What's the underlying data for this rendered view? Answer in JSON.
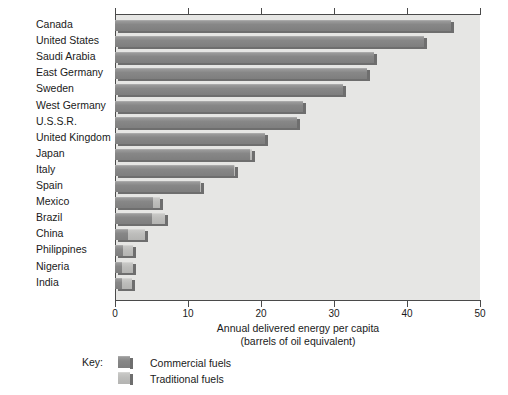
{
  "chart_data": {
    "type": "bar",
    "orientation": "horizontal",
    "title": "",
    "xlabel": "Annual delivered energy per capita",
    "xlabel_line2": "(barrels of oil equivalent)",
    "ylabel": "",
    "xlim": [
      0,
      50
    ],
    "xticks": [
      0,
      10,
      20,
      30,
      40,
      50
    ],
    "xtick_labels": [
      "0",
      "10",
      "20",
      "30",
      "40",
      "50"
    ],
    "grid": false,
    "stacked": true,
    "legend_position": "below-left",
    "legend_title": "Key:",
    "categories": [
      "Canada",
      "United States",
      "Saudi Arabia",
      "East Germany",
      "Sweden",
      "West Germany",
      "U.S.S.R.",
      "United Kingdom",
      "Japan",
      "Italy",
      "Spain",
      "Mexico",
      "Brazil",
      "China",
      "Philippines",
      "Nigeria",
      "India"
    ],
    "series": [
      {
        "name": "Commercial fuels",
        "color": "#878787",
        "values": [
          46.0,
          42.3,
          35.5,
          34.5,
          31.3,
          25.8,
          24.9,
          20.6,
          18.5,
          16.3,
          11.6,
          5.2,
          5.0,
          1.8,
          1.1,
          1.0,
          0.9
        ]
      },
      {
        "name": "Traditional fuels",
        "color": "#bdbdbb",
        "values": [
          0.0,
          0.0,
          0.0,
          0.0,
          0.0,
          0.0,
          0.0,
          0.0,
          0.3,
          0.2,
          0.2,
          1.0,
          1.9,
          2.3,
          1.4,
          1.4,
          1.4
        ]
      }
    ],
    "totals": [
      46.0,
      42.3,
      35.5,
      34.5,
      31.3,
      25.8,
      24.9,
      20.6,
      18.8,
      16.5,
      11.8,
      6.2,
      6.9,
      4.1,
      2.5,
      2.4,
      2.3
    ]
  },
  "legend": {
    "key_label": "Key:",
    "items": [
      {
        "label": "Commercial fuels",
        "swatch": "commercial"
      },
      {
        "label": "Traditional fuels",
        "swatch": "traditional"
      }
    ]
  },
  "axis": {
    "title_line1": "Annual delivered energy per capita",
    "title_line2": "(barrels of oil equivalent)"
  }
}
